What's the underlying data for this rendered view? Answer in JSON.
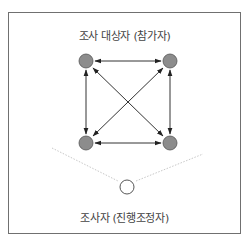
{
  "diagram": {
    "participants_label": "조사 대상자 (참가자)",
    "observer_label": "조사자 (진행조정자)",
    "participants": [
      {
        "id": "p1",
        "x": 86,
        "y": 61
      },
      {
        "id": "p2",
        "x": 170,
        "y": 61
      },
      {
        "id": "p3",
        "x": 86,
        "y": 143
      },
      {
        "id": "p4",
        "x": 170,
        "y": 143
      }
    ],
    "observer": {
      "x": 127,
      "y": 187
    },
    "connections": "all participants bidirectionally connected",
    "colors": {
      "participant_fill": "#8c8c8c",
      "participant_stroke": "#555555",
      "observer_fill": "#ffffff",
      "arrow": "#333333",
      "dotted_line": "#c8c8c8",
      "border": "#707070"
    }
  }
}
